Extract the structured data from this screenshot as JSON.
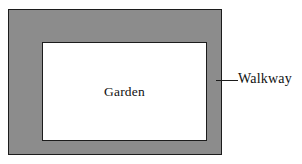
{
  "diagram": {
    "type": "geometry-figure",
    "background_color": "#ffffff",
    "outline_color": "#1c1c1c",
    "shapes": {
      "outer_rectangle": {
        "name": "walkway-outer-boundary",
        "fill_color": "#8c8c8c",
        "stroke_color": "#1c1c1c"
      },
      "inner_rectangle": {
        "name": "garden-area",
        "fill_color": "#ffffff",
        "stroke_color": "#1c1c1c"
      }
    },
    "labels": {
      "garden": "Garden",
      "walkway": "Walkway"
    },
    "leader_line": {
      "name": "walkway-leader-line",
      "color": "#1c1c1c"
    }
  }
}
